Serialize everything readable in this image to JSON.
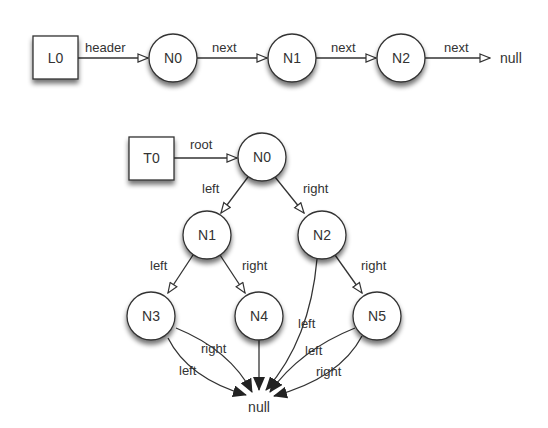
{
  "list": {
    "head": {
      "id": "L0",
      "label": "L0",
      "x": 33,
      "y": 36,
      "w": 45,
      "h": 43
    },
    "nodes": [
      {
        "id": "N0",
        "label": "N0",
        "cx": 173,
        "cy": 58
      },
      {
        "id": "N1",
        "label": "N1",
        "cx": 292,
        "cy": 58
      },
      {
        "id": "N2",
        "label": "N2",
        "cx": 401,
        "cy": 58
      }
    ],
    "edges": [
      {
        "label": "header"
      },
      {
        "label": "next"
      },
      {
        "label": "next"
      },
      {
        "label": "next"
      }
    ],
    "null_label": "null"
  },
  "tree": {
    "head": {
      "id": "T0",
      "label": "T0",
      "x": 129,
      "y": 137,
      "w": 45,
      "h": 43
    },
    "root_edge_label": "root",
    "nodes": [
      {
        "id": "N0",
        "label": "N0",
        "cx": 262,
        "cy": 157
      },
      {
        "id": "N1",
        "label": "N1",
        "cx": 207,
        "cy": 235
      },
      {
        "id": "N2",
        "label": "N2",
        "cx": 322,
        "cy": 235
      },
      {
        "id": "N3",
        "label": "N3",
        "cx": 151,
        "cy": 316
      },
      {
        "id": "N4",
        "label": "N4",
        "cx": 259,
        "cy": 316
      },
      {
        "id": "N5",
        "label": "N5",
        "cx": 377,
        "cy": 316
      }
    ],
    "edge_labels": {
      "n0_left": "left",
      "n0_right": "right",
      "n1_left": "left",
      "n1_right": "right",
      "n2_left": "left",
      "n2_right": "right",
      "n3_left": "left",
      "n3_right": "right",
      "n5_left": "left",
      "n5_right": "right"
    },
    "null_label": "null"
  },
  "colors": {
    "stroke": "#333333",
    "fill": "#ffffff",
    "text": "#333333",
    "shadow": "#888888"
  }
}
